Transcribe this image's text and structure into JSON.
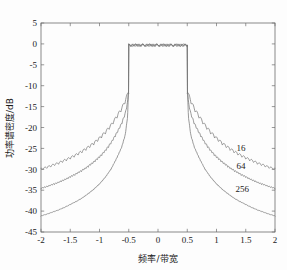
{
  "chart_data": {
    "type": "line",
    "title": "",
    "xlabel": "频率/带宽",
    "ylabel": "功率谱密度/dB",
    "xlim": [
      -2,
      2
    ],
    "ylim": [
      -45,
      5
    ],
    "grid": false,
    "legend_position": "inline-right",
    "xticks": [
      -2,
      -1.5,
      -1,
      -0.5,
      0,
      0.5,
      1,
      1.5,
      2
    ],
    "xtick_labels": [
      "-2",
      "-1.5",
      "-1",
      "-0.5",
      "0",
      "0.5",
      "1",
      "1.5",
      "2"
    ],
    "yticks": [
      5,
      0,
      -5,
      -10,
      -15,
      -20,
      -25,
      -30,
      -35,
      -40,
      -45
    ],
    "ytick_labels": [
      "5",
      "0",
      "-5",
      "-10",
      "-15",
      "-20",
      "-25",
      "-30",
      "-35",
      "-40",
      "-45"
    ],
    "band_edge": 0.5,
    "passband_level_db": 0,
    "passband_ripple_db": 0.6,
    "skirt_peak_db": -11.8,
    "series": [
      {
        "name": "16",
        "label": "16",
        "label_x": 1.42,
        "label_y": -25.6,
        "edge_value_db": -30.2,
        "x": [
          -2.0,
          -1.9,
          -1.8,
          -1.7,
          -1.6,
          -1.5,
          -1.4,
          -1.3,
          -1.2,
          -1.1,
          -1.0,
          -0.9,
          -0.8,
          -0.7,
          -0.62,
          -0.56,
          -0.52,
          -0.505,
          -0.5,
          -0.48,
          0.0,
          0.48,
          0.5,
          0.505,
          0.52,
          0.56,
          0.62,
          0.7,
          0.8,
          0.9,
          1.0,
          1.1,
          1.2,
          1.3,
          1.4,
          1.5,
          1.6,
          1.7,
          1.8,
          1.9,
          2.0
        ],
        "y": [
          -30.2,
          -29.8,
          -29.3,
          -28.8,
          -28.2,
          -27.6,
          -26.9,
          -26.1,
          -25.2,
          -24.2,
          -23.0,
          -21.6,
          -19.9,
          -17.8,
          -16.0,
          -14.2,
          -12.6,
          -11.8,
          0.0,
          0.0,
          0.0,
          0.0,
          0.0,
          -11.8,
          -12.6,
          -14.2,
          -16.0,
          -17.8,
          -19.9,
          -21.6,
          -23.0,
          -24.2,
          -25.2,
          -26.1,
          -26.9,
          -27.6,
          -28.2,
          -28.8,
          -29.3,
          -29.8,
          -30.2
        ]
      },
      {
        "name": "64",
        "label": "64",
        "label_x": 1.42,
        "label_y": -30.0,
        "edge_value_db": -34.7,
        "x": [
          -2.0,
          -1.9,
          -1.8,
          -1.7,
          -1.6,
          -1.5,
          -1.4,
          -1.3,
          -1.2,
          -1.1,
          -1.0,
          -0.9,
          -0.8,
          -0.7,
          -0.62,
          -0.56,
          -0.52,
          -0.505,
          -0.5,
          0.0,
          0.5,
          0.505,
          0.52,
          0.56,
          0.62,
          0.7,
          0.8,
          0.9,
          1.0,
          1.1,
          1.2,
          1.3,
          1.4,
          1.5,
          1.6,
          1.7,
          1.8,
          1.9,
          2.0
        ],
        "y": [
          -34.7,
          -34.3,
          -33.8,
          -33.3,
          -32.7,
          -32.0,
          -31.3,
          -30.5,
          -29.6,
          -28.5,
          -27.3,
          -25.8,
          -23.9,
          -21.5,
          -19.3,
          -17.0,
          -14.3,
          -11.8,
          0.0,
          0.0,
          0.0,
          -11.8,
          -14.3,
          -17.0,
          -19.3,
          -21.5,
          -23.9,
          -25.8,
          -27.3,
          -28.5,
          -29.6,
          -30.5,
          -31.3,
          -32.0,
          -32.7,
          -33.3,
          -33.8,
          -34.3,
          -34.7
        ]
      },
      {
        "name": "256",
        "label": "256",
        "label_x": 1.44,
        "label_y": -35.4,
        "edge_value_db": -41.2,
        "x": [
          -2.0,
          -1.9,
          -1.8,
          -1.7,
          -1.6,
          -1.5,
          -1.4,
          -1.3,
          -1.2,
          -1.1,
          -1.0,
          -0.9,
          -0.8,
          -0.7,
          -0.62,
          -0.56,
          -0.52,
          -0.505,
          -0.5,
          0.0,
          0.5,
          0.505,
          0.52,
          0.56,
          0.62,
          0.7,
          0.8,
          0.9,
          1.0,
          1.1,
          1.2,
          1.3,
          1.4,
          1.5,
          1.6,
          1.7,
          1.8,
          1.9,
          2.0
        ],
        "y": [
          -41.2,
          -40.8,
          -40.3,
          -39.8,
          -39.2,
          -38.5,
          -37.8,
          -37.0,
          -36.0,
          -34.9,
          -33.6,
          -32.0,
          -30.0,
          -27.3,
          -24.8,
          -21.9,
          -17.6,
          -11.8,
          0.0,
          0.0,
          0.0,
          -11.8,
          -17.6,
          -21.9,
          -24.8,
          -27.3,
          -30.0,
          -32.0,
          -33.6,
          -34.9,
          -36.0,
          -37.0,
          -37.8,
          -38.5,
          -39.2,
          -39.8,
          -40.3,
          -40.8,
          -41.2
        ]
      }
    ]
  },
  "colors": {
    "background": "#fdfdfd",
    "axis": "#6d6d6d",
    "curve": "#777777",
    "text": "#1a1a1a"
  }
}
